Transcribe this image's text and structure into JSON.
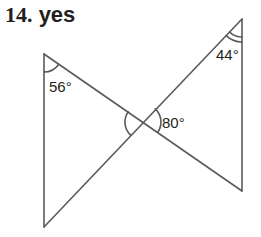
{
  "problem": {
    "number": "14.",
    "answer": "yes"
  },
  "figure": {
    "angles": [
      {
        "id": "left-top",
        "label": "56°",
        "arcs": 1
      },
      {
        "id": "right-top",
        "label": "44°",
        "arcs": 2
      },
      {
        "id": "vertical-right",
        "label": "80°",
        "arcs": 1
      },
      {
        "id": "vertical-left",
        "label": "",
        "arcs": 1
      }
    ],
    "colors": {
      "stroke": "#5a5a5a",
      "text": "#231f20"
    }
  }
}
